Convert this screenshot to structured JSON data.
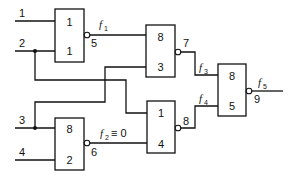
{
  "inputs": [
    {
      "label": "1"
    },
    {
      "label": "2"
    },
    {
      "label": "3"
    },
    {
      "label": "4"
    }
  ],
  "gates": [
    {
      "id": "g1",
      "top_label": "1",
      "bottom_label": "1",
      "output_label": "5"
    },
    {
      "id": "g2",
      "top_label": "8",
      "bottom_label": "2",
      "output_label": "6"
    },
    {
      "id": "g3",
      "top_label": "8",
      "bottom_label": "3",
      "output_label": "7"
    },
    {
      "id": "g4",
      "top_label": "1",
      "bottom_label": "4",
      "output_label": "8"
    },
    {
      "id": "g5",
      "top_label": "8",
      "bottom_label": "5",
      "output_label": "9"
    }
  ],
  "signals": {
    "f1": {
      "letter": "f",
      "sub": "1",
      "suffix": ""
    },
    "f2": {
      "letter": "f",
      "sub": "2",
      "suffix": "≡ 0"
    },
    "f3": {
      "letter": "f",
      "sub": "3",
      "suffix": ""
    },
    "f4": {
      "letter": "f",
      "sub": "4",
      "suffix": ""
    },
    "f5": {
      "letter": "f",
      "sub": "5",
      "suffix": ""
    }
  }
}
